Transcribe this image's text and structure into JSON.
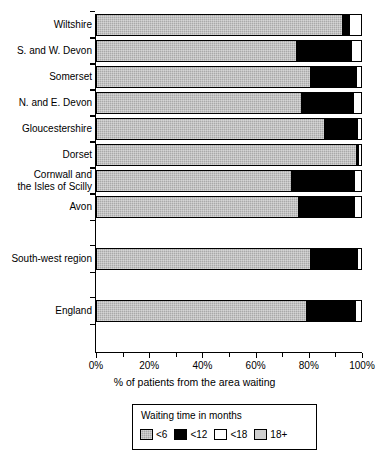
{
  "chart_data": {
    "type": "bar",
    "orientation": "horizontal",
    "stacked": true,
    "title": "",
    "xlabel": "% of patients from the area waiting",
    "ylabel": "",
    "xlim": [
      0,
      100
    ],
    "xticks": [
      0,
      20,
      40,
      60,
      80,
      100
    ],
    "xtick_labels": [
      "0%",
      "20%",
      "40%",
      "60%",
      "80%",
      "100%"
    ],
    "grid": false,
    "legend_position": "bottom",
    "legend_title": "Waiting time in months",
    "categories": [
      "Wiltshire",
      "S. and W. Devon",
      "Somerset",
      "N. and E. Devon",
      "Gloucestershire",
      "Dorset",
      "Cornwall and\nthe Isles of Scilly",
      "Avon",
      "South-west region",
      "England"
    ],
    "series": [
      {
        "name": "<6",
        "color": "#a9a9a9",
        "values": [
          92.9,
          75.2,
          80.5,
          77.1,
          86.1,
          98.1,
          73.3,
          76.3,
          80.5,
          79.0
        ]
      },
      {
        "name": "<12",
        "color": "#000000",
        "values": [
          2.6,
          21.0,
          17.6,
          19.9,
          12.4,
          0.8,
          24.0,
          21.0,
          17.9,
          18.8
        ]
      },
      {
        "name": "<18",
        "color": "#ffffff",
        "values": [
          4.5,
          3.8,
          1.9,
          3.0,
          1.5,
          1.1,
          2.7,
          2.7,
          1.6,
          2.2
        ]
      },
      {
        "name": "18+",
        "color": "#cfcfcf",
        "values": [
          0,
          0,
          0,
          0,
          0,
          0,
          0,
          0,
          0,
          0
        ]
      }
    ]
  },
  "legend": {
    "title": "Waiting time in months",
    "items": [
      {
        "label": "<6",
        "swatch": "sw-lt6"
      },
      {
        "label": "<12",
        "swatch": "sw-lt12"
      },
      {
        "label": "<18",
        "swatch": "sw-lt18"
      },
      {
        "label": "18+",
        "swatch": "sw-18p"
      }
    ]
  },
  "colors": {
    "lt6": "#a9a9a9",
    "lt12": "#000000",
    "lt18": "#ffffff",
    "p18": "#cfcfcf",
    "axis": "#000000",
    "background": "#ffffff"
  }
}
